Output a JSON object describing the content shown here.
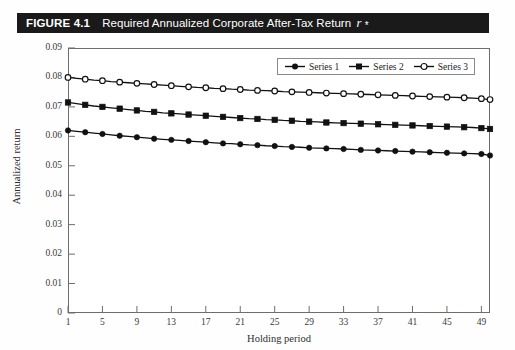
{
  "figure": {
    "number": "FIGURE 4.1",
    "caption_text": "Required Annualized Corporate After-Tax Return",
    "caption_symbol": "r",
    "caption_superscript": "*",
    "caption_subscript": "c"
  },
  "legend": {
    "position": "top-right-inside",
    "entries": [
      {
        "label": "Series 1",
        "marker": "filled-circle-marker",
        "color": "#111111"
      },
      {
        "label": "Series 2",
        "marker": "filled-square-marker",
        "color": "#111111"
      },
      {
        "label": "Series 3",
        "marker": "open-circle-marker",
        "color": "#111111"
      }
    ]
  },
  "chart_data": {
    "type": "line",
    "xlabel": "Holding period",
    "ylabel": "Annualized return",
    "xlim": [
      1,
      50
    ],
    "ylim": [
      0,
      0.09
    ],
    "grid": false,
    "ytick_labels": [
      "0",
      "0.01",
      "0.02",
      "0.03",
      "0.04",
      "0.05",
      "0.06",
      "0.07",
      "0.08",
      "0.09"
    ],
    "ytick_values": [
      0,
      0.01,
      0.02,
      0.03,
      0.04,
      0.05,
      0.06,
      0.07,
      0.08,
      0.09
    ],
    "xtick_labels": [
      "1",
      "5",
      "9",
      "13",
      "17",
      "21",
      "25",
      "29",
      "33",
      "37",
      "41",
      "45",
      "49"
    ],
    "xtick_values": [
      1,
      5,
      9,
      13,
      17,
      21,
      25,
      29,
      33,
      37,
      41,
      45,
      49
    ],
    "x": [
      1,
      2,
      3,
      4,
      5,
      6,
      7,
      8,
      9,
      10,
      11,
      12,
      13,
      14,
      15,
      16,
      17,
      18,
      19,
      20,
      21,
      22,
      23,
      24,
      25,
      26,
      27,
      28,
      29,
      30,
      31,
      32,
      33,
      34,
      35,
      36,
      37,
      38,
      39,
      40,
      41,
      42,
      43,
      44,
      45,
      46,
      47,
      48,
      49,
      50
    ],
    "series": [
      {
        "name": "Series 1",
        "marker": "filled-circle",
        "color": "#111111",
        "values": [
          0.062,
          0.0617,
          0.0614,
          0.0611,
          0.0608,
          0.0605,
          0.0602,
          0.06,
          0.0597,
          0.0595,
          0.0592,
          0.059,
          0.0588,
          0.0586,
          0.0584,
          0.0582,
          0.058,
          0.0578,
          0.0576,
          0.0575,
          0.0573,
          0.0571,
          0.057,
          0.0568,
          0.0567,
          0.0565,
          0.0564,
          0.0563,
          0.0561,
          0.056,
          0.0559,
          0.0558,
          0.0557,
          0.0556,
          0.0554,
          0.0553,
          0.0552,
          0.0551,
          0.055,
          0.0549,
          0.0548,
          0.0547,
          0.0546,
          0.0545,
          0.0544,
          0.0543,
          0.0542,
          0.0541,
          0.054,
          0.0535
        ]
      },
      {
        "name": "Series 2",
        "marker": "filled-square",
        "color": "#111111",
        "values": [
          0.0715,
          0.0711,
          0.0707,
          0.0703,
          0.07,
          0.0697,
          0.0694,
          0.0691,
          0.0688,
          0.0685,
          0.0683,
          0.068,
          0.0678,
          0.0676,
          0.0674,
          0.0672,
          0.067,
          0.0668,
          0.0666,
          0.0664,
          0.0662,
          0.066,
          0.0659,
          0.0657,
          0.0656,
          0.0654,
          0.0653,
          0.0651,
          0.065,
          0.0649,
          0.0647,
          0.0646,
          0.0645,
          0.0644,
          0.0643,
          0.0642,
          0.0641,
          0.064,
          0.0639,
          0.0638,
          0.0637,
          0.0636,
          0.0635,
          0.0634,
          0.0633,
          0.0632,
          0.0631,
          0.063,
          0.0628,
          0.0625
        ]
      },
      {
        "name": "Series 3",
        "marker": "open-circle",
        "color": "#111111",
        "values": [
          0.08,
          0.0797,
          0.0794,
          0.0791,
          0.0789,
          0.0786,
          0.0784,
          0.0782,
          0.078,
          0.0778,
          0.0776,
          0.0774,
          0.0772,
          0.077,
          0.0768,
          0.0766,
          0.0765,
          0.0763,
          0.0762,
          0.076,
          0.0759,
          0.0757,
          0.0756,
          0.0755,
          0.0754,
          0.0752,
          0.0751,
          0.075,
          0.0749,
          0.0748,
          0.0747,
          0.0746,
          0.0745,
          0.0744,
          0.0743,
          0.0742,
          0.0741,
          0.074,
          0.0739,
          0.0738,
          0.0737,
          0.0736,
          0.0735,
          0.0734,
          0.0733,
          0.0732,
          0.0731,
          0.073,
          0.0728,
          0.0725
        ]
      }
    ]
  }
}
